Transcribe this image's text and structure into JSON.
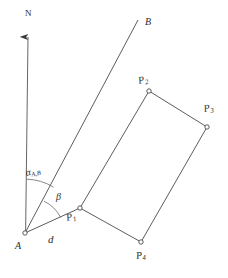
{
  "figure": {
    "type": "geometry-diagram",
    "width": 228,
    "height": 278,
    "background_color": "#ffffff",
    "stroke_color": "#4a4a4a",
    "text_color": "#2b2b2b"
  },
  "labels": {
    "north": "N",
    "station_a": "A",
    "target_b": "B",
    "distance_d": "d",
    "alpha_symbol": "α",
    "alpha_subscript": "A,B",
    "beta_symbol": "β",
    "p1_symbol": "P",
    "p1_subscript": "1",
    "p2_symbol": "P",
    "p2_subscript": "2",
    "p3_symbol": "P",
    "p3_subscript": "3",
    "p4_symbol": "P",
    "p4_subscript": "4"
  },
  "geometry": {
    "points": {
      "A": {
        "x": 25,
        "y": 233
      },
      "B": {
        "x": 138,
        "y": 20
      },
      "N": {
        "x": 28,
        "y": 34
      },
      "P1": {
        "x": 80,
        "y": 208
      },
      "P2": {
        "x": 149,
        "y": 91
      },
      "P3": {
        "x": 207,
        "y": 127
      },
      "P4": {
        "x": 141,
        "y": 242
      }
    },
    "segments": [
      {
        "name": "north-arrow",
        "from": "A",
        "to": "N"
      },
      {
        "name": "line-ab",
        "from": "A",
        "to": "B"
      },
      {
        "name": "line-a-p1",
        "from": "A",
        "to": "P1"
      },
      {
        "name": "line-p1-p2",
        "from": "P1",
        "to": "P2"
      },
      {
        "name": "line-p2-p3",
        "from": "P2",
        "to": "P3"
      },
      {
        "name": "line-p3-p4",
        "from": "P3",
        "to": "P4"
      },
      {
        "name": "line-p4-p1",
        "from": "P4",
        "to": "P1"
      }
    ],
    "arcs": [
      {
        "name": "alpha-arc",
        "radius": 54,
        "from": "north",
        "to": "line-ab"
      },
      {
        "name": "beta-arc",
        "radius": 36,
        "from": "line-ab",
        "to": "line-a-p1"
      }
    ],
    "vertex_markers": [
      "A",
      "P1",
      "P2",
      "P3",
      "P4"
    ]
  }
}
